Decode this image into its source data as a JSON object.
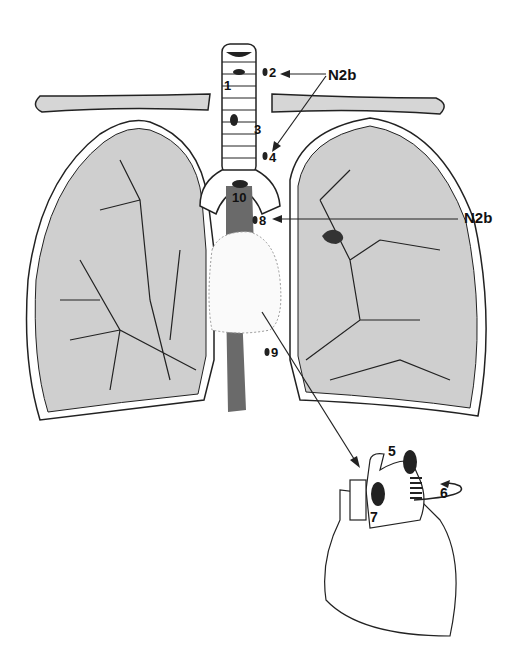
{
  "diagram": {
    "labels": {
      "n1": "1",
      "n2": "2",
      "n3": "3",
      "n4": "4",
      "n5": "5",
      "n6": "6",
      "n7": "7",
      "n8": "8",
      "n9": "9",
      "n10": "10"
    },
    "annotations": {
      "top": "N2b",
      "right": "N2b"
    },
    "colors": {
      "lung_fill": "#cfcfcf",
      "esophagus_fill": "#6a6a6a",
      "node_fill": "#222222",
      "outline": "#222222"
    }
  }
}
